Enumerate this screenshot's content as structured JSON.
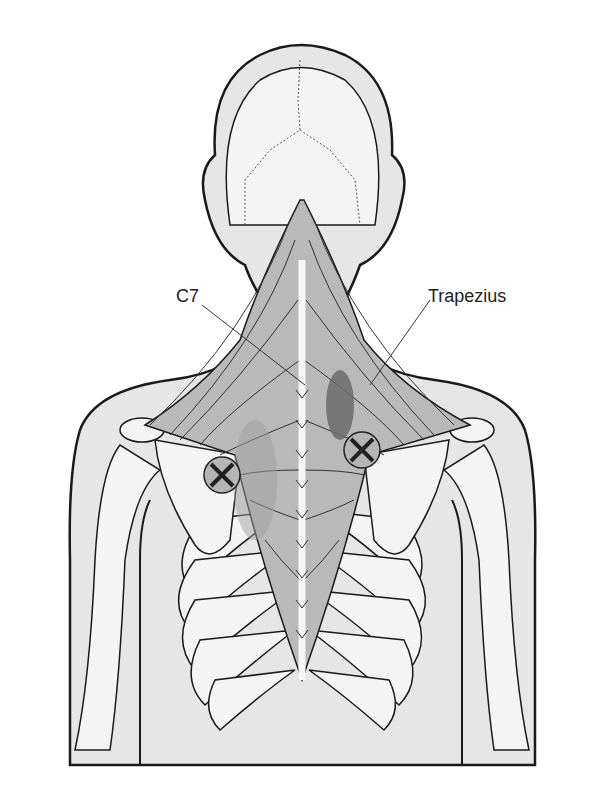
{
  "figure": {
    "labels": [
      {
        "id": "c7",
        "text": "C7",
        "x": 176,
        "y": 286
      },
      {
        "id": "trapezius",
        "text": "Trapezius",
        "x": 428,
        "y": 286
      }
    ],
    "markers": [
      {
        "id": "trigger-point-left",
        "cx": 222,
        "cy": 475,
        "r": 18
      },
      {
        "id": "trigger-point-right",
        "cx": 362,
        "cy": 450,
        "r": 18
      }
    ],
    "colors": {
      "outline": "#1a1a1a",
      "skin": "#e6e6e6",
      "bone": "#f4f4f4",
      "muscle": "#b9b9b9",
      "muscle_dark": "#9d9d9d",
      "referral_dark": "#6b6b6b",
      "referral_mid": "#a8a8a8"
    }
  }
}
